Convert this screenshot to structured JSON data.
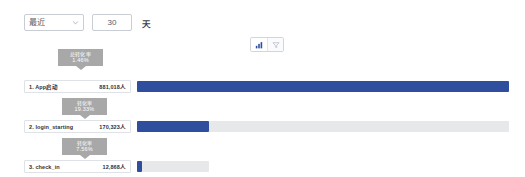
{
  "toolbar": {
    "range_select": {
      "value": "最近",
      "icon": "chevron-down-icon"
    },
    "days_input": {
      "value": "30",
      "placeholder": "30"
    },
    "unit_label": "天"
  },
  "view_toggle": {
    "buttons": [
      {
        "icon": "bar-chart-icon",
        "selected": true
      },
      {
        "icon": "funnel-chart-icon",
        "selected": false
      }
    ],
    "selected_color": "#2f4f9e",
    "unselected_color": "#b9bec6"
  },
  "funnel": {
    "total_badge": {
      "title": "总转化率",
      "value": "1.46%"
    },
    "bar_color": "#2f4f9e",
    "track_color": "#e6e8ea",
    "steps": [
      {
        "name": "1. App启动",
        "value": "881,018人",
        "bar_fill_pct": 100,
        "bar_track_pct": 100
      },
      {
        "name": "2. login_starting",
        "value": "170,323人",
        "bar_fill_pct": 19.33,
        "bar_track_pct": 100
      },
      {
        "name": "3. check_in",
        "value": "12,868人",
        "bar_fill_pct": 1.46,
        "bar_track_pct": 19.33
      }
    ],
    "conversions": [
      {
        "title": "转化率",
        "value": "19.33%"
      },
      {
        "title": "转化率",
        "value": "7.56%"
      }
    ]
  }
}
